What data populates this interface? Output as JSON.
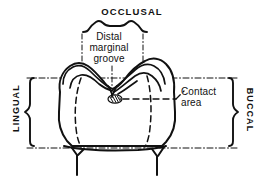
{
  "figure": {
    "background_color": "#ffffff",
    "ink_color": "#111111"
  },
  "labels": {
    "occlusal": "OCCLUSAL",
    "distal_marginal_groove": "Distal\nmarginal\ngroove",
    "contact_area": "Contact\narea",
    "lingual": "LINGUAL",
    "buccal": "BUCCAL"
  },
  "annotations": {
    "occlusal_brace": "brace-occlusal",
    "lingual_brace": "brace-lingual",
    "buccal_brace": "brace-buccal",
    "groove_callout_box": "dash-dot-callout-box",
    "contact_leader": "dashed-leader-line",
    "contact_mark": "hatched-contact-oval"
  }
}
